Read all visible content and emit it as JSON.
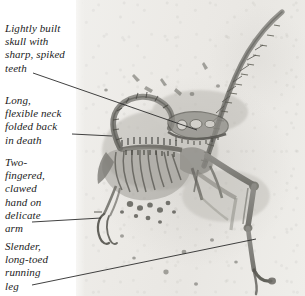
{
  "figure": {
    "kind": "annotated-fossil-photograph",
    "plate_background_color": "#ecebe7",
    "bone_color": "#7e7d78",
    "leader_line_color": "#2b2b2b",
    "caption_text_color": "#1b1b1b"
  },
  "captions": [
    {
      "id": "skull",
      "name": "caption-skull",
      "lines": [
        "Lightly built",
        "skull with",
        "sharp, spiked",
        "teeth"
      ],
      "text": "Lightly built skull with sharp, spiked teeth"
    },
    {
      "id": "neck",
      "name": "caption-neck",
      "lines": [
        "Long,",
        "flexible neck",
        "folded back",
        "in death"
      ],
      "text": "Long, flexible neck folded back in death"
    },
    {
      "id": "hand",
      "name": "caption-hand",
      "lines": [
        "Two-",
        "fingered,",
        "clawed",
        "hand on",
        "delicate",
        "arm"
      ],
      "text": "Two-fingered, clawed hand on delicate arm"
    },
    {
      "id": "leg",
      "name": "caption-leg",
      "lines": [
        "Slender,",
        "long-toed",
        "running",
        "leg"
      ],
      "text": "Slender, long-toed running leg"
    }
  ],
  "leader_lines": [
    {
      "id": "skull",
      "from": [
        33,
        73
      ],
      "to": [
        197,
        130
      ]
    },
    {
      "id": "neck",
      "from": [
        72,
        134
      ],
      "to": [
        112,
        136
      ]
    },
    {
      "id": "hand",
      "from": [
        32,
        222
      ],
      "to": [
        101,
        218
      ]
    },
    {
      "id": "leg",
      "from": [
        32,
        285
      ],
      "to": [
        256,
        239
      ]
    }
  ]
}
